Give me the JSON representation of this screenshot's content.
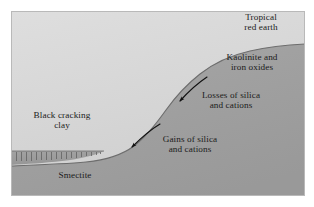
{
  "figure": {
    "type": "cross-section-diagram",
    "panel": {
      "x": 11,
      "y": 11,
      "width": 294,
      "height": 185,
      "upper_fill": "#d8d8d8",
      "lower_fill": "#a0a0a0",
      "border_color": "#b4b4b4",
      "page_background": "#ffffff"
    }
  },
  "labels": {
    "tropical_red_earth": "Tropical\nred earth",
    "kaolinite_iron_oxides": "Kaolinite and\niron oxides",
    "losses": "Losses of silica\nand cations",
    "gains": "Gains of silica\nand cations",
    "black_cracking_clay": "Black cracking\nclay",
    "smectite": "Smectite"
  },
  "arrows": [
    {
      "name": "losses-arrow",
      "label": "Losses of silica and cations",
      "direction": "downslope-left",
      "from": [
        207,
        77
      ],
      "to": [
        175,
        106
      ],
      "color": "#111111"
    },
    {
      "name": "gains-arrow",
      "label": "Gains of silica and cations",
      "direction": "downslope-left",
      "from": [
        160,
        124
      ],
      "to": [
        127,
        152
      ],
      "color": "#111111"
    }
  ],
  "layers": [
    {
      "name": "upper-slope-surface",
      "description": "Light gray upper zone above the S-shaped land surface",
      "fill": "#d8d8d8"
    },
    {
      "name": "lower-regolith",
      "description": "Darker gray zone below the land surface",
      "fill": "#a0a0a0"
    },
    {
      "name": "smectite-band",
      "description": "Hatched band at lower left representing smectite clay",
      "fill": "#9a9a9a",
      "hatch_color": "#5a5a5a",
      "hatch_count": 19
    }
  ],
  "surface_curve": {
    "name": "land-surface",
    "description": "S-shaped slope profile descending from right (tropical red earth plateau) to left (black cracking clay plain)",
    "color": "#6d6d6d",
    "points": [
      [
        305,
        44
      ],
      [
        268,
        47
      ],
      [
        232,
        57
      ],
      [
        200,
        74
      ],
      [
        172,
        100
      ],
      [
        148,
        128
      ],
      [
        124,
        148
      ],
      [
        96,
        158
      ],
      [
        58,
        163
      ],
      [
        11,
        166
      ]
    ]
  }
}
